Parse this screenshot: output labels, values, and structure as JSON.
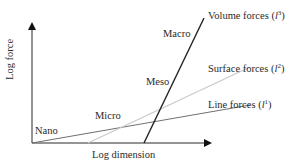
{
  "diagram": {
    "axes": {
      "x_label": "Log dimension",
      "y_label": "Log force"
    },
    "regimes": [
      {
        "label": "Nano"
      },
      {
        "label": "Micro"
      },
      {
        "label": "Meso"
      },
      {
        "label": "Macro"
      }
    ],
    "lines": [
      {
        "name": "Volume forces",
        "exponent": "3",
        "color": "#2b2b2b"
      },
      {
        "name": "Surface forces",
        "exponent": "2",
        "color": "#c4c4c4"
      },
      {
        "name": "Line forces",
        "exponent": "1",
        "color": "#6f6f6f"
      }
    ],
    "symbol": "l"
  }
}
